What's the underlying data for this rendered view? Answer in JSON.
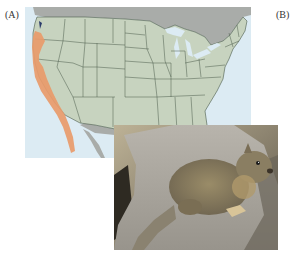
{
  "figure": {
    "panels": [
      {
        "label": "(A)",
        "content": "map of United States showing species range"
      },
      {
        "label": "(B)",
        "content": "photograph of ground squirrel on rock"
      }
    ],
    "map": {
      "region": "Contiguous United States with Canada and Mexico",
      "highlighted_range": "Pacific coast: Washington, Oregon, California, northern Baja California",
      "colors": {
        "land": "#c7d3bf",
        "state_lines": "#4a5a4a",
        "neighbor_land": "#a9aca9",
        "water": "#dcebf3",
        "range": "#e89a6a"
      }
    },
    "photo": {
      "subject": "ground squirrel",
      "colors": {
        "rock": "#a8a49c",
        "fur": "#8a7d5e",
        "background": "#6b6452"
      }
    }
  }
}
